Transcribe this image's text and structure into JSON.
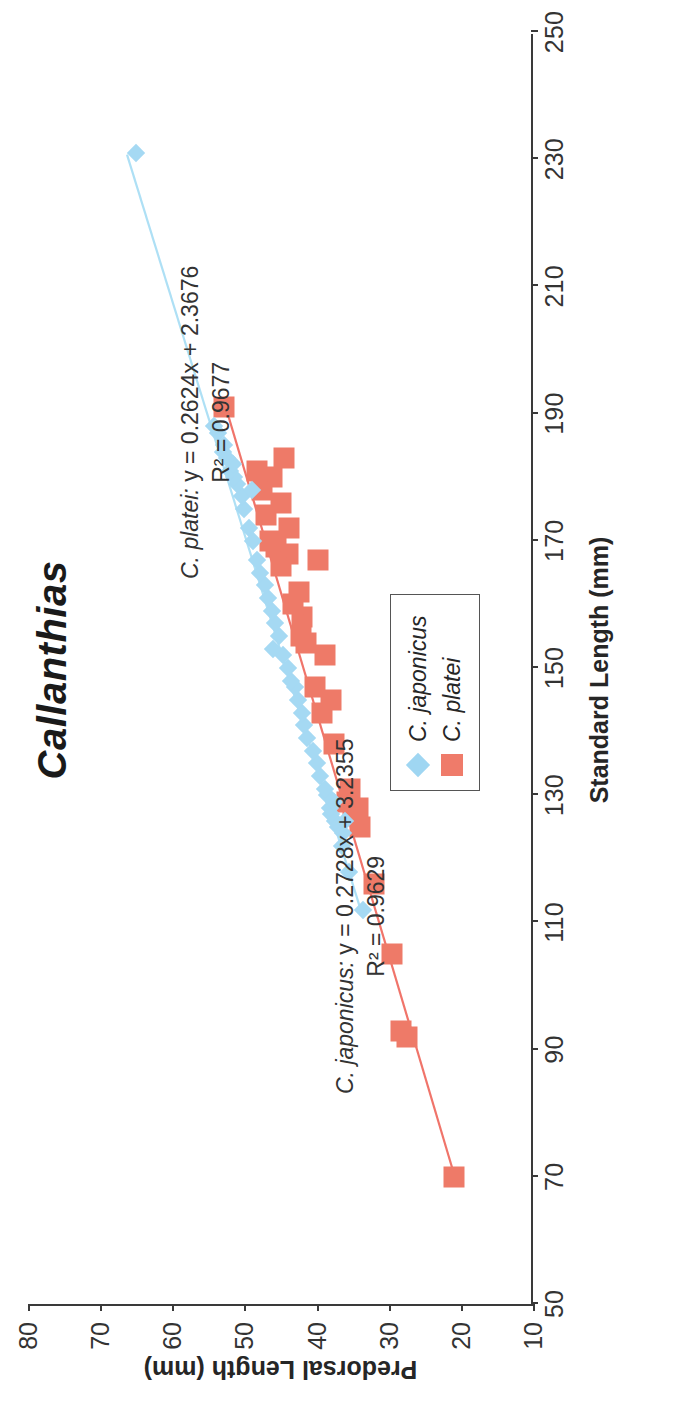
{
  "chart_data": {
    "type": "scatter",
    "title": "Callanthias",
    "xlabel": "Standard Length (mm)",
    "ylabel": "Predorsal Length (mm)",
    "xlim": [
      50,
      250
    ],
    "ylim": [
      10,
      80
    ],
    "xticks": [
      50,
      70,
      90,
      110,
      130,
      150,
      170,
      190,
      210,
      230,
      250
    ],
    "yticks": [
      10,
      20,
      30,
      40,
      50,
      60,
      70,
      80
    ],
    "grid": false,
    "legend_position": "bottom-right",
    "series": [
      {
        "name": "C. japonicus",
        "marker": "diamond",
        "color": "#A5D9F3",
        "trendline": {
          "equation": "y = 0.2728x + 3.2355",
          "r2": "R² = 0.9629",
          "slope": 0.2728,
          "intercept": 3.2355,
          "x_start": 112,
          "x_end": 231
        },
        "points": [
          [
            112,
            33.5
          ],
          [
            118,
            35.5
          ],
          [
            122,
            36.5
          ],
          [
            124,
            36.4
          ],
          [
            125,
            37.0
          ],
          [
            126,
            37.4
          ],
          [
            126,
            36.0
          ],
          [
            127,
            38.0
          ],
          [
            128,
            38.2
          ],
          [
            129,
            37.6
          ],
          [
            130,
            38.5
          ],
          [
            131,
            38.8
          ],
          [
            133,
            39.5
          ],
          [
            135,
            40.0
          ],
          [
            137,
            40.5
          ],
          [
            139,
            41.3
          ],
          [
            141,
            41.8
          ],
          [
            143,
            42.0
          ],
          [
            145,
            42.6
          ],
          [
            147,
            43.0
          ],
          [
            148,
            43.5
          ],
          [
            150,
            44.0
          ],
          [
            152,
            44.6
          ],
          [
            153,
            46.0
          ],
          [
            155,
            45.2
          ],
          [
            157,
            45.8
          ],
          [
            159,
            46.2
          ],
          [
            161,
            46.8
          ],
          [
            163,
            47.2
          ],
          [
            165,
            47.8
          ],
          [
            167,
            48.2
          ],
          [
            170,
            48.8
          ],
          [
            172,
            49.4
          ],
          [
            175,
            50.0
          ],
          [
            177,
            50.4
          ],
          [
            178,
            49.0
          ],
          [
            179,
            51.0
          ],
          [
            180,
            51.4
          ],
          [
            181,
            52.0
          ],
          [
            182,
            51.6
          ],
          [
            183,
            52.4
          ],
          [
            184,
            53.0
          ],
          [
            185,
            52.8
          ],
          [
            187,
            53.6
          ],
          [
            188,
            54.2
          ],
          [
            231,
            65.0
          ]
        ]
      },
      {
        "name": "C. platei",
        "marker": "square",
        "color": "#EE7A68",
        "trendline": {
          "equation": "y = 0.2624x + 2.3676",
          "r2": "R² = 0.9677",
          "slope": 0.2624,
          "intercept": 2.3676,
          "x_start": 70,
          "x_end": 191
        },
        "points": [
          [
            70,
            21.0
          ],
          [
            92,
            27.5
          ],
          [
            93,
            28.3
          ],
          [
            105,
            29.5
          ],
          [
            116,
            32.0
          ],
          [
            125,
            34.0
          ],
          [
            127,
            35.0
          ],
          [
            128,
            34.3
          ],
          [
            129,
            35.8
          ],
          [
            131,
            35.3
          ],
          [
            138,
            37.6
          ],
          [
            143,
            39.3
          ],
          [
            145,
            38.0
          ],
          [
            147,
            40.2
          ],
          [
            152,
            38.8
          ],
          [
            154,
            41.5
          ],
          [
            155,
            42.2
          ],
          [
            158,
            42.0
          ],
          [
            160,
            43.2
          ],
          [
            162,
            42.5
          ],
          [
            166,
            45.0
          ],
          [
            167,
            39.8
          ],
          [
            168,
            44.0
          ],
          [
            169,
            45.6
          ],
          [
            170,
            46.5
          ],
          [
            172,
            43.8
          ],
          [
            174,
            47.0
          ],
          [
            176,
            45.0
          ],
          [
            178,
            47.6
          ],
          [
            180,
            46.2
          ],
          [
            181,
            48.2
          ],
          [
            183,
            44.5
          ],
          [
            191,
            52.8
          ]
        ]
      }
    ]
  },
  "title": {
    "text": "Callanthias"
  },
  "axes": {
    "x": {
      "label": "Standard Length (mm)",
      "ticks": [
        "50",
        "70",
        "90",
        "110",
        "130",
        "150",
        "170",
        "190",
        "210",
        "230",
        "250"
      ]
    },
    "y": {
      "label": "Predorsal Length (mm)",
      "ticks": [
        "10",
        "20",
        "30",
        "40",
        "50",
        "60",
        "70",
        "80"
      ]
    }
  },
  "annotations": {
    "japonicus": {
      "species": "C. japonicus:",
      "equation": "y = 0.2728x + 3.2355",
      "r2": "R² = 0.9629"
    },
    "platei": {
      "species": "C. platei:",
      "equation": "y = 0.2624x + 2.3676",
      "r2": "R² = 0.9677"
    }
  },
  "legend": {
    "items": [
      {
        "label": "C. japonicus",
        "color": "#A5D9F3",
        "marker": "diamond"
      },
      {
        "label": "C. platei",
        "color": "#EE7A68",
        "marker": "square"
      }
    ]
  }
}
